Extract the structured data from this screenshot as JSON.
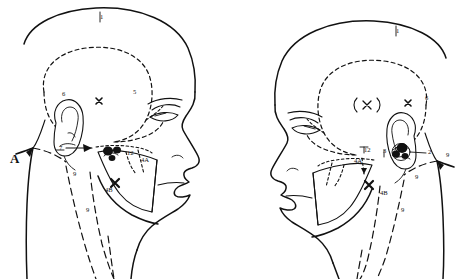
{
  "figure": {
    "background_color": "#ffffff",
    "ink_color": "#111111",
    "panels": [
      {
        "id": "left-panel",
        "panel_label": "A",
        "facing": "right",
        "labels": [
          {
            "key": "l1",
            "text": "1",
            "x": 100,
            "y": 19
          },
          {
            "key": "l6",
            "text": "6",
            "x": 62,
            "y": 96
          },
          {
            "key": "l5",
            "text": "5",
            "x": 133,
            "y": 94
          },
          {
            "key": "lx1",
            "text": "x",
            "x": 99,
            "y": 101
          },
          {
            "key": "l7",
            "text": "7",
            "x": 59,
            "y": 150
          },
          {
            "key": "l12",
            "text": "12",
            "x": 127,
            "y": 155
          },
          {
            "key": "l4a",
            "text": "4A",
            "x": 141,
            "y": 162
          },
          {
            "key": "l4b",
            "text": "4B",
            "x": 105,
            "y": 192
          },
          {
            "key": "lx2",
            "text": "x",
            "x": 115,
            "y": 183
          },
          {
            "key": "l9a",
            "text": "9",
            "x": 73,
            "y": 176
          },
          {
            "key": "l9b",
            "text": "9",
            "x": 86,
            "y": 212
          }
        ]
      },
      {
        "id": "right-panel",
        "panel_label": "",
        "facing": "left",
        "labels": [
          {
            "key": "r1",
            "text": "1",
            "x": 396,
            "y": 33
          },
          {
            "key": "rxp",
            "text": "(x)",
            "x": 366,
            "y": 107
          },
          {
            "key": "rx1",
            "text": "x",
            "x": 408,
            "y": 104
          },
          {
            "key": "r6",
            "text": "6",
            "x": 425,
            "y": 100
          },
          {
            "key": "r2",
            "text": "2",
            "x": 428,
            "y": 154
          },
          {
            "key": "r3",
            "text": "3",
            "x": 383,
            "y": 153
          },
          {
            "key": "r12",
            "text": "12",
            "x": 364,
            "y": 152
          },
          {
            "key": "r4a",
            "text": "4A",
            "x": 354,
            "y": 163
          },
          {
            "key": "r4b",
            "text": "4B",
            "x": 380,
            "y": 195
          },
          {
            "key": "rx2",
            "text": "x",
            "x": 369,
            "y": 186
          },
          {
            "key": "r9a",
            "text": "9",
            "x": 415,
            "y": 179
          },
          {
            "key": "r9b",
            "text": "9",
            "x": 401,
            "y": 212
          },
          {
            "key": "r9c",
            "text": "9",
            "x": 446,
            "y": 157
          }
        ]
      }
    ]
  }
}
